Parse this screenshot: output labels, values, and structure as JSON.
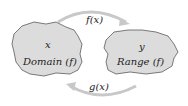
{
  "diagram": {
    "domain_set": {
      "variable": "x",
      "label": "Domain (f)"
    },
    "range_set": {
      "variable": "y",
      "label": "Range (f)"
    },
    "forward_arrow": {
      "label": "f(x)"
    },
    "inverse_arrow": {
      "label": "g(x)"
    },
    "colors": {
      "blob_fill": "#dcdcdc",
      "blob_stroke": "#5a5a5a",
      "arrow": "#c8c8c8"
    }
  }
}
